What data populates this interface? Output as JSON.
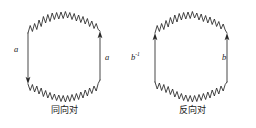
{
  "figure": {
    "title_visible": false,
    "background_color": "#ffffff",
    "stroke_color": "#262626",
    "panels": [
      {
        "id": "same-direction-pair",
        "caption": "同向对",
        "left_edge": {
          "label": "a",
          "label_superscript": "",
          "arrow_direction": "down",
          "arrow_position": "bottom"
        },
        "right_edge": {
          "label": "a",
          "label_superscript": "",
          "arrow_direction": "up",
          "arrow_position": "top"
        },
        "top_boundary": "wavy-arc",
        "bottom_boundary": "wavy-arc"
      },
      {
        "id": "opposite-direction-pair",
        "caption": "反向对",
        "left_edge": {
          "label": "b",
          "label_superscript": "-1",
          "arrow_direction": "up",
          "arrow_position": "top"
        },
        "right_edge": {
          "label": "b",
          "label_superscript": "",
          "arrow_direction": "up",
          "arrow_position": "top"
        },
        "top_boundary": "wavy-arc",
        "bottom_boundary": "wavy-arc"
      }
    ]
  }
}
